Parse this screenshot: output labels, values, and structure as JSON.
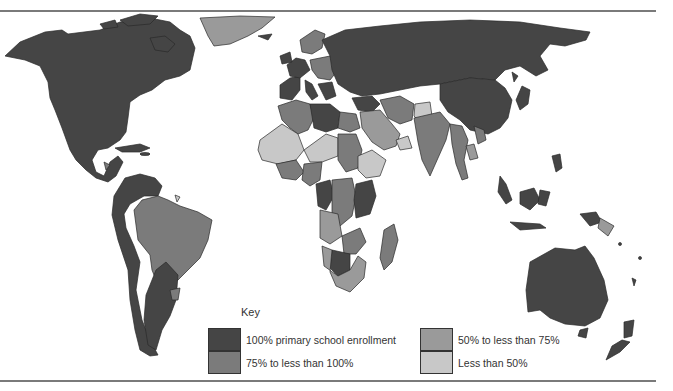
{
  "legend": {
    "title": "Key",
    "items": [
      {
        "label": "100% primary school enrollment",
        "color": "#454545"
      },
      {
        "label": "75% to less than 100%",
        "color": "#7b7b7b"
      },
      {
        "label": "50% to less than 75%",
        "color": "#9a9a9a"
      },
      {
        "label": "Less than 50%",
        "color": "#c8c8c8"
      }
    ]
  },
  "map": {
    "type": "choropleth world map",
    "subject": "Primary school enrollment by country",
    "regions": {
      "north_america": "100% primary school enrollment",
      "greenland": "50% to less than 75%",
      "central_america": "75% to less than 100%",
      "brazil": "75% to less than 100%",
      "europe_russia_china": "100% primary school enrollment",
      "middle_east": "50% to less than 75%",
      "india": "75% to less than 100%",
      "west_africa_sahel": "Less than 50%",
      "central_east_africa": "75% to less than 100%",
      "australia": "100% primary school enrollment",
      "papua_new_guinea": "50% to less than 75%"
    }
  }
}
